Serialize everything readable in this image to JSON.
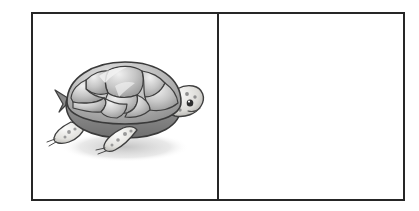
{
  "page": {
    "background_color": "#ffffff",
    "width": 419,
    "height": 211
  },
  "frame": {
    "border_color": "#262626",
    "border_width_px": 2,
    "divider_color": "#262626",
    "panel_count": 2
  },
  "panels": [
    {
      "id": "left",
      "name": "picture-panel",
      "content_type": "illustration",
      "filled": true,
      "fill_color": "#ffffff"
    },
    {
      "id": "right",
      "name": "blank-answer-panel",
      "content_type": "empty",
      "filled": false,
      "fill_color": "#ffffff"
    }
  ],
  "illustration": {
    "subject": "tortoise",
    "alt_text": "Grayscale drawing of a tortoise facing right",
    "style": "grayscale pencil shading",
    "orientation": "facing-right",
    "colors": {
      "outline": "#3a3a3a",
      "shell_dark": "#8d8d8d",
      "shell_mid": "#a9a9a9",
      "shell_light": "#d7d7d7",
      "shell_highlight": "#eeeeee",
      "body_dark": "#7c7c7c",
      "skin_light": "#f2f1ee",
      "spot": "#9a9a9a",
      "shadow": "#cfcfcf"
    },
    "parts": [
      "shell",
      "shell-scutes",
      "head",
      "eye",
      "front-leg",
      "hind-leg",
      "tail",
      "cast-shadow"
    ]
  }
}
